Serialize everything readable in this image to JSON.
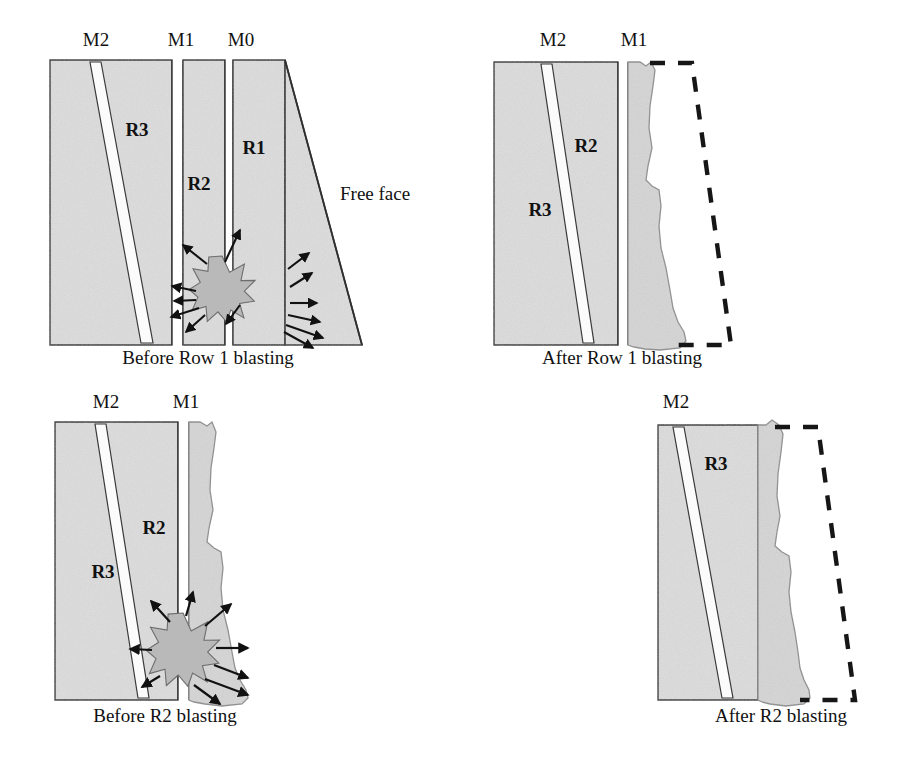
{
  "figure": {
    "type": "technical-diagram",
    "background_color": "#ffffff",
    "rock_fill_color": "#dcdcdc",
    "muckpile_fill_color": "#d5d5d5",
    "seam_fill_color": "#fbfbfb",
    "star_fill_color": "#b9b9b9",
    "outline_color": "#2b2b2b",
    "dashed_color": "#161616"
  },
  "panels": [
    {
      "id": "panel-before-row-1",
      "caption": "Before Row 1 blasting",
      "caption_x": 208,
      "caption_y": 364,
      "seam_labels": [
        {
          "text": "M2",
          "x": 96,
          "y": 46
        },
        {
          "text": "M1",
          "x": 181,
          "y": 46
        },
        {
          "text": "M0",
          "x": 241,
          "y": 46
        }
      ],
      "row_labels": [
        {
          "text": "R3",
          "x": 137,
          "y": 136
        },
        {
          "text": "R2",
          "x": 199,
          "y": 190
        },
        {
          "text": "R1",
          "x": 254,
          "y": 154
        }
      ],
      "annotations": [
        {
          "text": "Free face",
          "x": 340,
          "y": 200
        }
      ],
      "has_explosion": true,
      "explosion": {
        "cx": 222,
        "cy": 289,
        "r_outer": 33,
        "r_inner": 19,
        "points": 13
      },
      "has_dashed_outline": false,
      "has_free_face": true
    },
    {
      "id": "panel-after-row-1",
      "caption": "After Row 1 blasting",
      "caption_x": 622,
      "caption_y": 364,
      "seam_labels": [
        {
          "text": "M2",
          "x": 553,
          "y": 46
        },
        {
          "text": "M1",
          "x": 634,
          "y": 46
        }
      ],
      "row_labels": [
        {
          "text": "R2",
          "x": 586,
          "y": 152
        },
        {
          "text": "R3",
          "x": 540,
          "y": 216
        }
      ],
      "annotations": [],
      "has_explosion": false,
      "has_dashed_outline": true,
      "has_free_face": false
    },
    {
      "id": "panel-before-r2",
      "caption": "Before R2 blasting",
      "caption_x": 165,
      "caption_y": 722,
      "seam_labels": [
        {
          "text": "M2",
          "x": 106,
          "y": 408
        },
        {
          "text": "M1",
          "x": 186,
          "y": 408
        }
      ],
      "row_labels": [
        {
          "text": "R2",
          "x": 154,
          "y": 534
        },
        {
          "text": "R3",
          "x": 103,
          "y": 578
        }
      ],
      "annotations": [],
      "has_explosion": true,
      "explosion": {
        "cx": 183,
        "cy": 650,
        "r_outer": 37,
        "r_inner": 21,
        "points": 14
      },
      "has_dashed_outline": false,
      "has_free_face": false
    },
    {
      "id": "panel-after-r2",
      "caption": "After R2 blasting",
      "caption_x": 781,
      "caption_y": 722,
      "seam_labels": [
        {
          "text": "M2",
          "x": 676,
          "y": 408
        }
      ],
      "row_labels": [
        {
          "text": "R3",
          "x": 716,
          "y": 470
        }
      ],
      "annotations": [],
      "has_explosion": false,
      "has_dashed_outline": true,
      "has_free_face": false
    }
  ]
}
